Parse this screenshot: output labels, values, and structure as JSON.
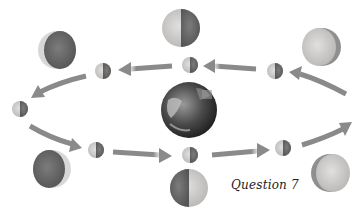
{
  "diagram": {
    "caption": "Question 7",
    "center_body": "earth",
    "colors": {
      "arrow": "#8a8a8a",
      "moon_light": "#d6d4d2",
      "moon_dark": "#6e6e6e",
      "earth_dark": "#2e2e2e",
      "earth_light": "#bdbdbd",
      "background": "#ffffff"
    },
    "orbit_positions": [
      {
        "id": "top-right",
        "label": "small moon"
      },
      {
        "id": "top-center",
        "label": "small moon"
      },
      {
        "id": "top-left",
        "label": "small moon"
      },
      {
        "id": "left",
        "label": "small moon"
      },
      {
        "id": "bottom-left",
        "label": "small moon"
      },
      {
        "id": "bottom-center",
        "label": "small moon"
      },
      {
        "id": "bottom-right",
        "label": "small moon"
      }
    ],
    "phase_views": [
      {
        "id": "view-top-left",
        "label": "waning crescent view"
      },
      {
        "id": "view-top-center",
        "label": "quarter view"
      },
      {
        "id": "view-top-right",
        "label": "gibbous view"
      },
      {
        "id": "view-bottom-left",
        "label": "crescent view"
      },
      {
        "id": "view-bottom-center",
        "label": "quarter view"
      },
      {
        "id": "view-bottom-right",
        "label": "gibbous view"
      }
    ],
    "orbit_direction": "counterclockwise"
  }
}
